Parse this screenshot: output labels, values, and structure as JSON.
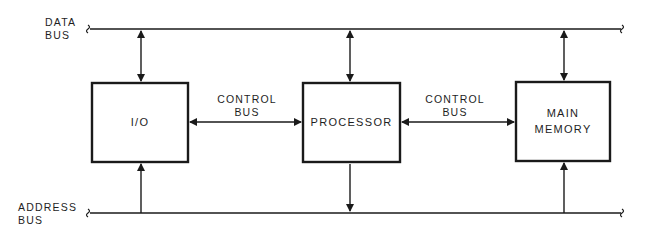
{
  "diagram": {
    "buses": {
      "data_bus": {
        "line1": "DATA",
        "line2": "BUS"
      },
      "address_bus": {
        "line1": "ADDRESS",
        "line2": "BUS"
      },
      "control_bus_left": {
        "line1": "CONTROL",
        "line2": "BUS"
      },
      "control_bus_right": {
        "line1": "CONTROL",
        "line2": "BUS"
      }
    },
    "blocks": {
      "io": {
        "label": "I/O"
      },
      "processor": {
        "label": "PROCESSOR"
      },
      "memory": {
        "line1": "MAIN",
        "line2": "MEMORY"
      }
    },
    "colors": {
      "stroke": "#1a1a1a",
      "background": "#ffffff"
    }
  }
}
